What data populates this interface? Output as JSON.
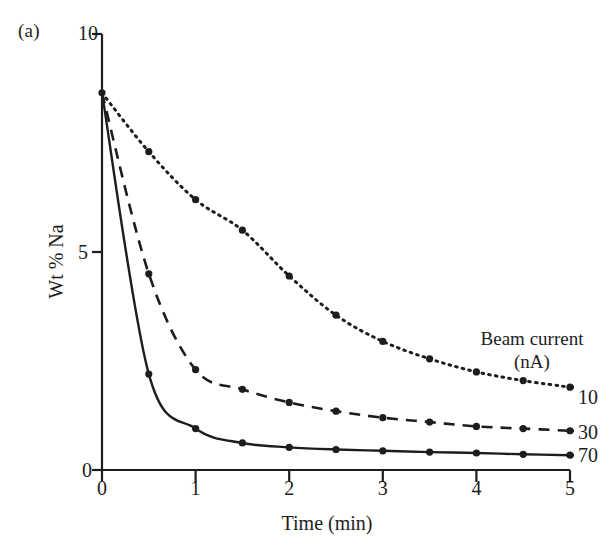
{
  "figure": {
    "panel_label": "(a)",
    "background": "#ffffff",
    "ink_color": "#1d1d1d"
  },
  "legend": {
    "title_line1": "Beam current",
    "title_line2": "(nA)",
    "entries": [
      {
        "label": "10",
        "style": "dotted"
      },
      {
        "label": "30",
        "style": "dashed"
      },
      {
        "label": "70",
        "style": "solid"
      }
    ]
  },
  "axes": {
    "x_title": "Time (min)",
    "y_title": "Wt % Na",
    "x_ticks": [
      "0",
      "1",
      "2",
      "3",
      "4",
      "5"
    ],
    "y_ticks": [
      "0",
      "5",
      "10"
    ]
  },
  "chart_data": {
    "type": "line",
    "title": "",
    "subtitle": "",
    "xlabel": "Time (min)",
    "ylabel": "Wt % Na",
    "xlim": [
      0,
      5
    ],
    "ylim": [
      0,
      10
    ],
    "xticks": [
      0,
      1,
      2,
      3,
      4,
      5
    ],
    "yticks": [
      0,
      5,
      10
    ],
    "grid": false,
    "legend_position": "right-of-curve-ends",
    "legend_title": "Beam current (nA)",
    "annotations": [
      "(a)"
    ],
    "x": [
      0,
      0.5,
      1,
      1.5,
      2,
      2.5,
      3,
      3.5,
      4,
      4.5,
      5
    ],
    "series": [
      {
        "name": "10",
        "style": "dotted",
        "marker": "filled-circle",
        "values": [
          8.65,
          7.3,
          6.2,
          5.5,
          4.45,
          3.55,
          2.95,
          2.55,
          2.25,
          2.05,
          1.9
        ]
      },
      {
        "name": "30",
        "style": "dashed",
        "marker": "filled-circle",
        "values": [
          8.65,
          4.5,
          2.3,
          1.85,
          1.55,
          1.35,
          1.2,
          1.1,
          1.0,
          0.95,
          0.9
        ]
      },
      {
        "name": "70",
        "style": "solid",
        "marker": "filled-circle",
        "values": [
          8.65,
          2.2,
          0.95,
          0.62,
          0.52,
          0.47,
          0.44,
          0.41,
          0.39,
          0.36,
          0.34
        ]
      }
    ]
  }
}
